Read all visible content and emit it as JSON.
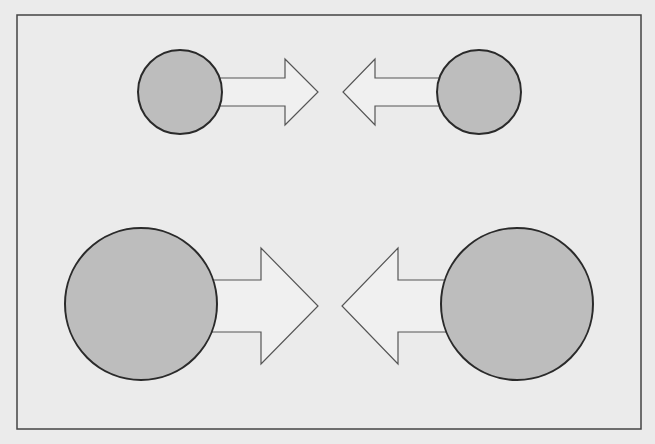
{
  "diagram": {
    "background": "#ebebeb",
    "frame": {
      "x": 17,
      "y": 15,
      "width": 624,
      "height": 414,
      "stroke": "#444444"
    },
    "circle_fill": "#bdbdbd",
    "circle_stroke": "#2a2a2a",
    "arrow_fill": "#f0f0f0",
    "arrow_stroke": "#555555",
    "rows": [
      {
        "label": "small-pair",
        "left": {
          "circle": {
            "cx": 180,
            "cy": 92,
            "r": 42
          },
          "arrow": {
            "direction": "right",
            "shaft_start": 220,
            "shaft_top": 78,
            "shaft_bottom": 106,
            "head_base": 285,
            "head_top": 59,
            "head_bottom": 125,
            "tip_x": 318,
            "tip_y": 92
          }
        },
        "right": {
          "circle": {
            "cx": 479,
            "cy": 92,
            "r": 42
          },
          "arrow": {
            "direction": "left",
            "shaft_start": 440,
            "shaft_top": 78,
            "shaft_bottom": 106,
            "head_base": 375,
            "head_top": 59,
            "head_bottom": 125,
            "tip_x": 343,
            "tip_y": 92
          }
        }
      },
      {
        "label": "large-pair",
        "left": {
          "circle": {
            "cx": 141,
            "cy": 304,
            "r": 76
          },
          "arrow": {
            "direction": "right",
            "shaft_start": 210,
            "shaft_top": 280,
            "shaft_bottom": 332,
            "head_base": 261,
            "head_top": 248,
            "head_bottom": 364,
            "tip_x": 318,
            "tip_y": 306
          }
        },
        "right": {
          "circle": {
            "cx": 517,
            "cy": 304,
            "r": 76
          },
          "arrow": {
            "direction": "left",
            "shaft_start": 448,
            "shaft_top": 280,
            "shaft_bottom": 332,
            "head_base": 398,
            "head_top": 248,
            "head_bottom": 364,
            "tip_x": 342,
            "tip_y": 306
          }
        }
      }
    ]
  }
}
